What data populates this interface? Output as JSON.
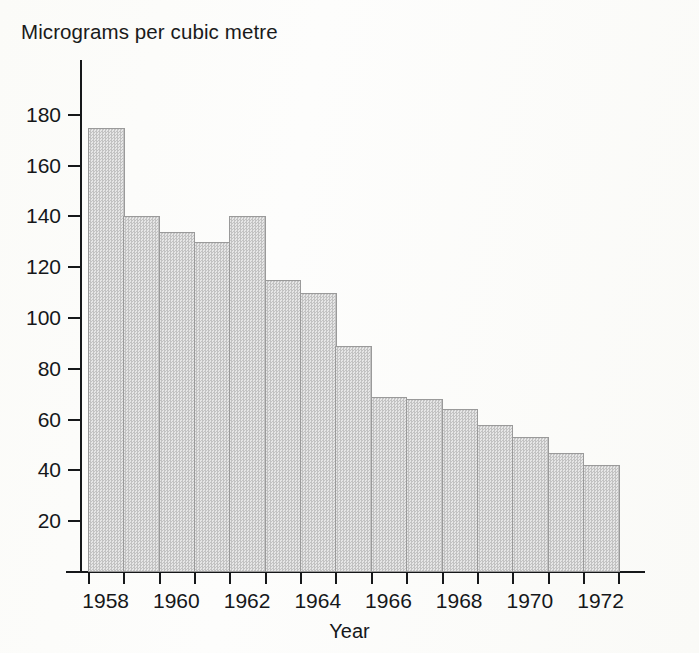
{
  "chart_data": {
    "type": "bar",
    "title": "Micrograms per cubic metre",
    "subtitle": "",
    "xlabel": "Year",
    "ylabel": "Micrograms per cubic metre",
    "categories": [
      1958,
      1959,
      1960,
      1961,
      1962,
      1963,
      1964,
      1965,
      1966,
      1967,
      1968,
      1969,
      1970,
      1971,
      1972
    ],
    "values": [
      175,
      140,
      134,
      130,
      140,
      115,
      110,
      89,
      69,
      68,
      64,
      58,
      53,
      47,
      42
    ],
    "series": [
      {
        "name": "Smoke concentration",
        "values": [
          175,
          140,
          134,
          130,
          140,
          115,
          110,
          89,
          69,
          68,
          64,
          58,
          53,
          47,
          42
        ]
      }
    ],
    "ylim": [
      0,
      190
    ],
    "xlim": [
      1958,
      1973
    ],
    "y_ticks": [
      20,
      40,
      60,
      80,
      100,
      120,
      140,
      160,
      180
    ],
    "y_tick_labels": [
      "20",
      "40",
      "60",
      "80",
      "100",
      "120",
      "140",
      "160",
      "180"
    ],
    "x_tick_labels": [
      "1958",
      "1960",
      "1962",
      "1964",
      "1966",
      "1968",
      "1970",
      "1972"
    ],
    "x_tick_values": [
      1958,
      1960,
      1962,
      1964,
      1966,
      1968,
      1970,
      1972
    ],
    "grid": false,
    "legend": false,
    "legend_position": "none",
    "bar_fill_color": "#d3d3d3",
    "bar_edge_color": "#9a9a9a",
    "axis_color": "#16181a",
    "background_color": "#fdfdfb"
  },
  "labels": {
    "title": "Micrograms per cubic metre",
    "x_axis_title": "Year"
  }
}
